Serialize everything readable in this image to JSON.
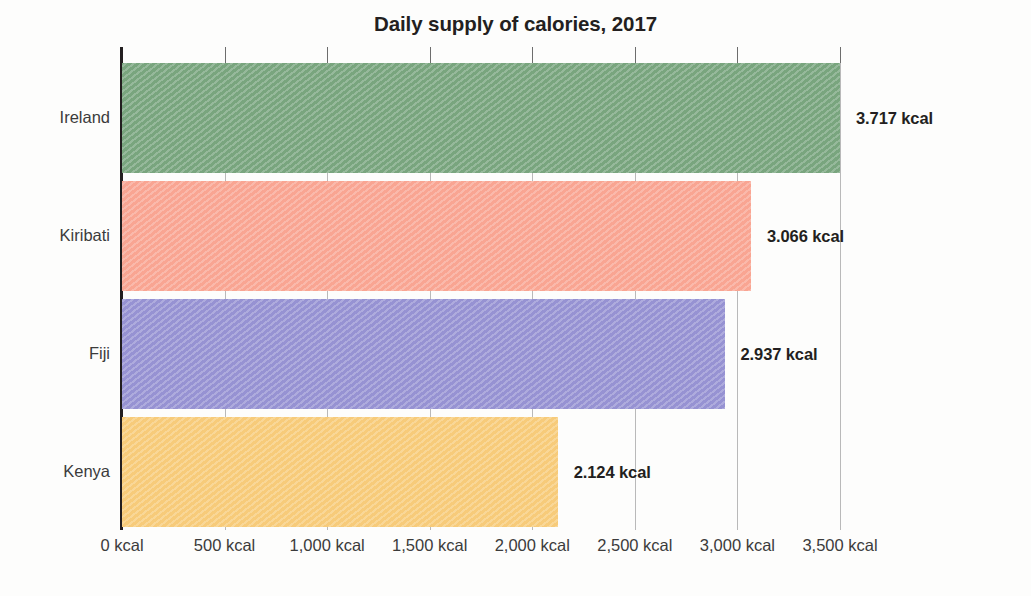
{
  "chart_data": {
    "type": "bar",
    "orientation": "horizontal",
    "title": "Daily supply of calories, 2017",
    "xlabel": "",
    "ylabel": "",
    "categories": [
      "Ireland",
      "Kiribati",
      "Fiji",
      "Kenya"
    ],
    "values": [
      3717,
      3066,
      2937,
      2124
    ],
    "value_labels": [
      "3.717 kcal",
      "3.066 kcal",
      "2.937 kcal",
      "2.124 kcal"
    ],
    "unit": "kcal",
    "xlim": [
      0,
      3500
    ],
    "xticks": [
      0,
      500,
      1000,
      1500,
      2000,
      2500,
      3000,
      3500
    ],
    "xtick_labels": [
      "0 kcal",
      "500 kcal",
      "1,000 kcal",
      "1,500 kcal",
      "2,000 kcal",
      "2,500 kcal",
      "3,000 kcal",
      "3,500 kcal"
    ],
    "grid": true,
    "legend": false,
    "series": [
      {
        "name": "Daily supply of calories",
        "values": [
          3717,
          3066,
          2937,
          2124
        ]
      }
    ],
    "bar_colors": [
      "#7da882",
      "#f9a896",
      "#9a96d4",
      "#f7cd7e"
    ],
    "bars": [
      {
        "category": "Ireland",
        "value": 3717,
        "label": "3.717 kcal",
        "color": "#7da882"
      },
      {
        "category": "Kiribati",
        "value": 3066,
        "label": "3.066 kcal",
        "color": "#f9a896"
      },
      {
        "category": "Fiji",
        "value": 2937,
        "label": "2.937 kcal",
        "color": "#9a96d4"
      },
      {
        "category": "Kenya",
        "value": 2124,
        "label": "2.124 kcal",
        "color": "#f7cd7e"
      }
    ]
  },
  "colors": {
    "background": "#fdfdfc",
    "axis": "#231f20",
    "gridline": "#b9b9b9",
    "title_text": "#231f20",
    "label_text": "#3b3b3b",
    "value_text": "#231f20"
  }
}
